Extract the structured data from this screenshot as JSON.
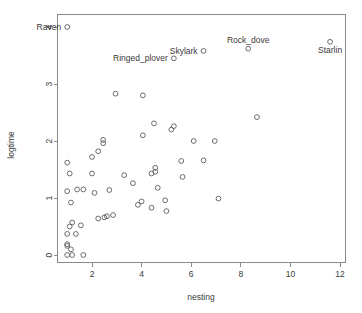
{
  "chart_data": {
    "type": "scatter",
    "title": "",
    "xlabel": "nesting",
    "ylabel": "logtime",
    "xlim": [
      0.5,
      12.2
    ],
    "ylim": [
      -0.18,
      4.25
    ],
    "xticks": [
      2,
      4,
      6,
      8,
      10,
      12
    ],
    "yticks": [
      0,
      1,
      2,
      3,
      4
    ],
    "grid": false,
    "legend": null,
    "marker": "open-circle",
    "points": [
      {
        "x": 1.0,
        "y": 4.0,
        "label": "Raven",
        "label_pos": "left"
      },
      {
        "x": 8.3,
        "y": 3.62,
        "label": "Rock_dove",
        "label_pos": "above"
      },
      {
        "x": 11.6,
        "y": 3.74,
        "label": "Starlin",
        "label_pos": "below"
      },
      {
        "x": 6.5,
        "y": 3.58,
        "label": "Skylark",
        "label_pos": "left"
      },
      {
        "x": 5.3,
        "y": 3.45,
        "label": "Ringed_plover",
        "label_pos": "left"
      },
      {
        "x": 2.95,
        "y": 2.83,
        "label": null,
        "label_pos": null
      },
      {
        "x": 4.05,
        "y": 2.8,
        "label": null,
        "label_pos": null
      },
      {
        "x": 8.65,
        "y": 2.42,
        "label": null,
        "label_pos": null
      },
      {
        "x": 4.5,
        "y": 2.31,
        "label": null,
        "label_pos": null
      },
      {
        "x": 5.3,
        "y": 2.26,
        "label": null,
        "label_pos": null
      },
      {
        "x": 5.2,
        "y": 2.2,
        "label": null,
        "label_pos": null
      },
      {
        "x": 4.05,
        "y": 2.1,
        "label": null,
        "label_pos": null
      },
      {
        "x": 2.45,
        "y": 2.02,
        "label": null,
        "label_pos": null
      },
      {
        "x": 2.45,
        "y": 1.96,
        "label": null,
        "label_pos": null
      },
      {
        "x": 6.1,
        "y": 2.0,
        "label": null,
        "label_pos": null
      },
      {
        "x": 6.95,
        "y": 2.0,
        "label": null,
        "label_pos": null
      },
      {
        "x": 2.25,
        "y": 1.82,
        "label": null,
        "label_pos": null
      },
      {
        "x": 2.0,
        "y": 1.72,
        "label": null,
        "label_pos": null
      },
      {
        "x": 5.6,
        "y": 1.65,
        "label": null,
        "label_pos": null
      },
      {
        "x": 6.5,
        "y": 1.66,
        "label": null,
        "label_pos": null
      },
      {
        "x": 1.0,
        "y": 1.62,
        "label": null,
        "label_pos": null
      },
      {
        "x": 4.55,
        "y": 1.53,
        "label": null,
        "label_pos": null
      },
      {
        "x": 4.55,
        "y": 1.46,
        "label": null,
        "label_pos": null
      },
      {
        "x": 4.4,
        "y": 1.43,
        "label": null,
        "label_pos": null
      },
      {
        "x": 1.1,
        "y": 1.43,
        "label": null,
        "label_pos": null
      },
      {
        "x": 2.0,
        "y": 1.43,
        "label": null,
        "label_pos": null
      },
      {
        "x": 3.3,
        "y": 1.4,
        "label": null,
        "label_pos": null
      },
      {
        "x": 5.65,
        "y": 1.37,
        "label": null,
        "label_pos": null
      },
      {
        "x": 3.65,
        "y": 1.26,
        "label": null,
        "label_pos": null
      },
      {
        "x": 4.65,
        "y": 1.18,
        "label": null,
        "label_pos": null
      },
      {
        "x": 2.7,
        "y": 1.14,
        "label": null,
        "label_pos": null
      },
      {
        "x": 1.4,
        "y": 1.15,
        "label": null,
        "label_pos": null
      },
      {
        "x": 1.65,
        "y": 1.15,
        "label": null,
        "label_pos": null
      },
      {
        "x": 1.0,
        "y": 1.12,
        "label": null,
        "label_pos": null
      },
      {
        "x": 2.1,
        "y": 1.09,
        "label": null,
        "label_pos": null
      },
      {
        "x": 7.1,
        "y": 0.99,
        "label": null,
        "label_pos": null
      },
      {
        "x": 4.95,
        "y": 0.96,
        "label": null,
        "label_pos": null
      },
      {
        "x": 4.0,
        "y": 0.94,
        "label": null,
        "label_pos": null
      },
      {
        "x": 1.15,
        "y": 0.92,
        "label": null,
        "label_pos": null
      },
      {
        "x": 3.85,
        "y": 0.88,
        "label": null,
        "label_pos": null
      },
      {
        "x": 4.4,
        "y": 0.83,
        "label": null,
        "label_pos": null
      },
      {
        "x": 5.0,
        "y": 0.77,
        "label": null,
        "label_pos": null
      },
      {
        "x": 2.85,
        "y": 0.7,
        "label": null,
        "label_pos": null
      },
      {
        "x": 2.6,
        "y": 0.68,
        "label": null,
        "label_pos": null
      },
      {
        "x": 2.5,
        "y": 0.66,
        "label": null,
        "label_pos": null
      },
      {
        "x": 2.25,
        "y": 0.64,
        "label": null,
        "label_pos": null
      },
      {
        "x": 1.2,
        "y": 0.57,
        "label": null,
        "label_pos": null
      },
      {
        "x": 1.55,
        "y": 0.52,
        "label": null,
        "label_pos": null
      },
      {
        "x": 1.1,
        "y": 0.5,
        "label": null,
        "label_pos": null
      },
      {
        "x": 1.0,
        "y": 0.37,
        "label": null,
        "label_pos": null
      },
      {
        "x": 1.35,
        "y": 0.37,
        "label": null,
        "label_pos": null
      },
      {
        "x": 1.0,
        "y": 0.19,
        "label": null,
        "label_pos": null
      },
      {
        "x": 1.0,
        "y": 0.16,
        "label": null,
        "label_pos": null
      },
      {
        "x": 1.15,
        "y": 0.1,
        "label": null,
        "label_pos": null
      },
      {
        "x": 1.0,
        "y": 0.0,
        "label": null,
        "label_pos": null
      },
      {
        "x": 1.2,
        "y": 0.0,
        "label": null,
        "label_pos": null
      },
      {
        "x": 1.65,
        "y": 0.0,
        "label": null,
        "label_pos": null
      }
    ]
  },
  "plot": {
    "xlabel": "nesting",
    "ylabel": "logtime",
    "xtick_labels": [
      "2",
      "4",
      "6",
      "8",
      "10",
      "12"
    ],
    "ytick_labels": [
      "0",
      "1",
      "2",
      "3",
      "4"
    ],
    "point_labels": [
      "Raven",
      "Rock_dove",
      "Starlin",
      "Skylark",
      "Ringed_plover"
    ],
    "colors": {
      "background": "#ffffff",
      "axis": "#8a8a8a",
      "marker": "#5c5c5c",
      "text": "#3a3a3a"
    }
  }
}
